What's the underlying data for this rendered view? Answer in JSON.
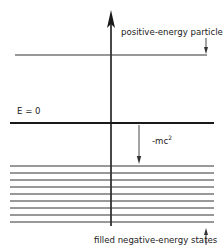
{
  "diagram": {
    "labels": {
      "positive_particle": "positive-energy particle",
      "zero_energy": "E = 0",
      "gap_base": "-mc",
      "gap_exp": "2",
      "filled_states": "filled negative-energy states"
    },
    "colors": {
      "line": "#1a1a1a",
      "thin_line": "#333333",
      "background": "#ffffff"
    },
    "filled_levels_count": 9
  }
}
